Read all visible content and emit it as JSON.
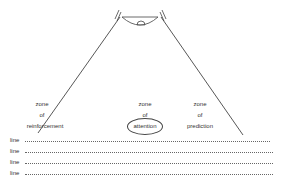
{
  "diagram": {
    "zones": [
      {
        "id": "reinforcement",
        "lines": [
          "zone",
          "of",
          "reinforcement"
        ]
      },
      {
        "id": "attention",
        "lines": [
          "zone",
          "of",
          "attention"
        ],
        "circled": "attention"
      },
      {
        "id": "prediction",
        "lines": [
          "zone",
          "of",
          "prediction"
        ]
      }
    ],
    "rows": [
      {
        "label": "line"
      },
      {
        "label": "line"
      },
      {
        "label": "line"
      },
      {
        "label": "line"
      }
    ],
    "colors": {
      "stroke": "#444444",
      "text": "#333333",
      "background": "#ffffff"
    }
  }
}
